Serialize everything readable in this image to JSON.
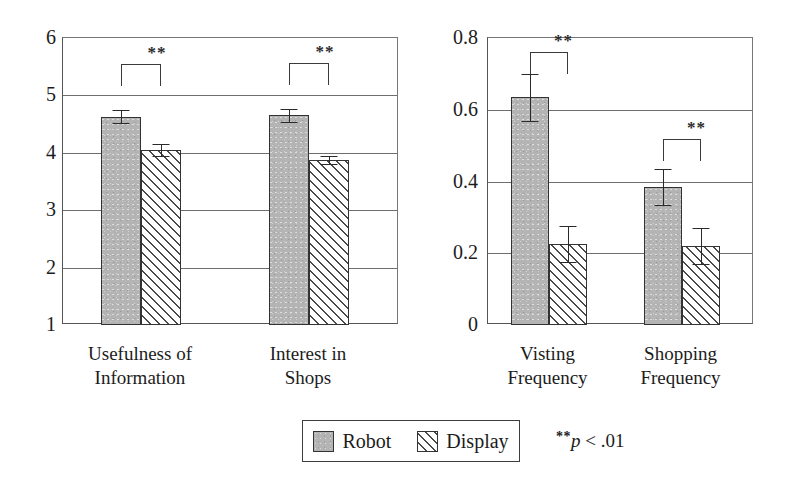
{
  "figure": {
    "background_color": "#ffffff",
    "series_colors": {
      "robot": "#b4b4b4",
      "display": "#ffffff",
      "outline": "#333333"
    }
  },
  "legend": {
    "entries": [
      {
        "key": "robot",
        "label": "Robot",
        "swatch": "solid-gray-swatch"
      },
      {
        "key": "display",
        "label": "Display",
        "swatch": "diagonal-hatch-swatch"
      }
    ],
    "note_stars": "**",
    "note_p": "p",
    "note_value": " < .01",
    "note_full": "** p < .01"
  },
  "chart_data": [
    {
      "type": "bar",
      "id": "left-chart",
      "title": "",
      "xlabel": "",
      "ylabel": "",
      "grid": true,
      "legend_position": "below-figure-center",
      "categories": [
        "Usefulness of Information",
        "Interest in Shops"
      ],
      "category_lines": [
        [
          "Usefulness of",
          "Information"
        ],
        [
          "Interest in",
          "Shops"
        ]
      ],
      "ylim": [
        1,
        6
      ],
      "yticks": [
        1,
        2,
        3,
        4,
        5,
        6
      ],
      "ytick_labels": [
        "1",
        "2",
        "3",
        "4",
        "5",
        "6"
      ],
      "series": [
        {
          "name": "Robot",
          "values": [
            4.63,
            4.65
          ],
          "errors": [
            0.11,
            0.12
          ]
        },
        {
          "name": "Display",
          "values": [
            4.05,
            3.88
          ],
          "errors": [
            0.1,
            0.07
          ]
        }
      ],
      "annotations": [
        {
          "category": "Usefulness of Information",
          "text": "**",
          "meaning": "p < .01"
        },
        {
          "category": "Interest in Shops",
          "text": "**",
          "meaning": "p < .01"
        }
      ]
    },
    {
      "type": "bar",
      "id": "right-chart",
      "title": "",
      "xlabel": "",
      "ylabel": "",
      "grid": true,
      "legend_position": "below-figure-center",
      "categories": [
        "Visting Frequency",
        "Shopping Frequency"
      ],
      "category_lines": [
        [
          "Visting",
          "Frequency"
        ],
        [
          "Shopping",
          "Frequency"
        ]
      ],
      "ylim": [
        0,
        0.8
      ],
      "yticks": [
        0,
        0.2,
        0.4,
        0.6,
        0.8
      ],
      "ytick_labels": [
        "0",
        "0.2",
        "0.4",
        "0.6",
        "0.8"
      ],
      "series": [
        {
          "name": "Robot",
          "values": [
            0.635,
            0.385
          ],
          "errors": [
            0.065,
            0.05
          ]
        },
        {
          "name": "Display",
          "values": [
            0.225,
            0.22
          ],
          "errors": [
            0.05,
            0.05
          ]
        }
      ],
      "annotations": [
        {
          "category": "Visting Frequency",
          "text": "**",
          "meaning": "p < .01"
        },
        {
          "category": "Shopping Frequency",
          "text": "**",
          "meaning": "p < .01"
        }
      ]
    }
  ]
}
